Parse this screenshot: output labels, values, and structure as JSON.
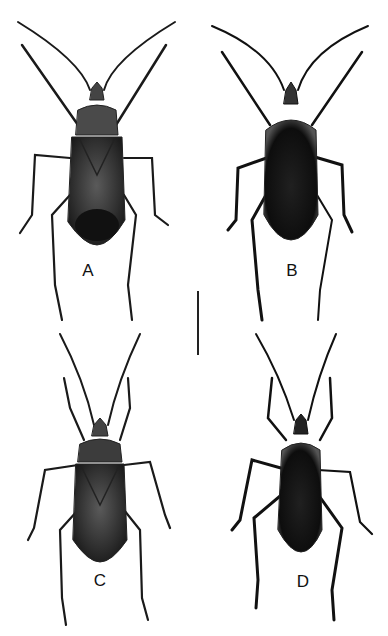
{
  "figure": {
    "panels": [
      {
        "label": "A",
        "view": "dorsal",
        "x": 88,
        "y": 270
      },
      {
        "label": "B",
        "view": "ventral",
        "x": 292,
        "y": 270
      },
      {
        "label": "C",
        "view": "dorsal",
        "x": 100,
        "y": 580
      },
      {
        "label": "D",
        "view": "ventral",
        "x": 303,
        "y": 581
      }
    ],
    "scale_bar": {
      "orientation": "vertical",
      "x": 198,
      "y_top": 291,
      "y_bottom": 355
    }
  }
}
